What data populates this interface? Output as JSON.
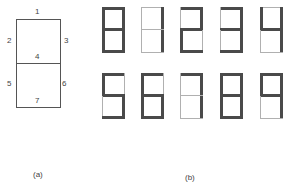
{
  "panel_a": {
    "caption": "(a)",
    "segment_labels": [
      "1",
      "2",
      "3",
      "4",
      "5",
      "6",
      "7"
    ]
  },
  "panel_b": {
    "caption": "(b)",
    "digits": [
      {
        "value": "8",
        "segments": [
          1,
          2,
          3,
          4,
          5,
          6,
          7
        ]
      },
      {
        "value": "1",
        "segments": [
          3,
          6
        ]
      },
      {
        "value": "2",
        "segments": [
          1,
          3,
          4,
          5,
          7
        ]
      },
      {
        "value": "3",
        "segments": [
          1,
          3,
          4,
          6,
          7
        ]
      },
      {
        "value": "4",
        "segments": [
          2,
          3,
          4,
          6
        ]
      },
      {
        "value": "5",
        "segments": [
          1,
          2,
          4,
          6,
          7
        ]
      },
      {
        "value": "6",
        "segments": [
          1,
          2,
          4,
          5,
          6,
          7
        ]
      },
      {
        "value": "7",
        "segments": [
          1,
          3,
          6
        ]
      },
      {
        "value": "8",
        "segments": [
          1,
          2,
          3,
          4,
          5,
          6,
          7
        ]
      },
      {
        "value": "9",
        "segments": [
          1,
          2,
          3,
          4,
          6
        ]
      }
    ]
  },
  "colors": {
    "segment_on": "#4a4a4a",
    "segment_off": "#b0b0b0",
    "outline": "#555555"
  }
}
